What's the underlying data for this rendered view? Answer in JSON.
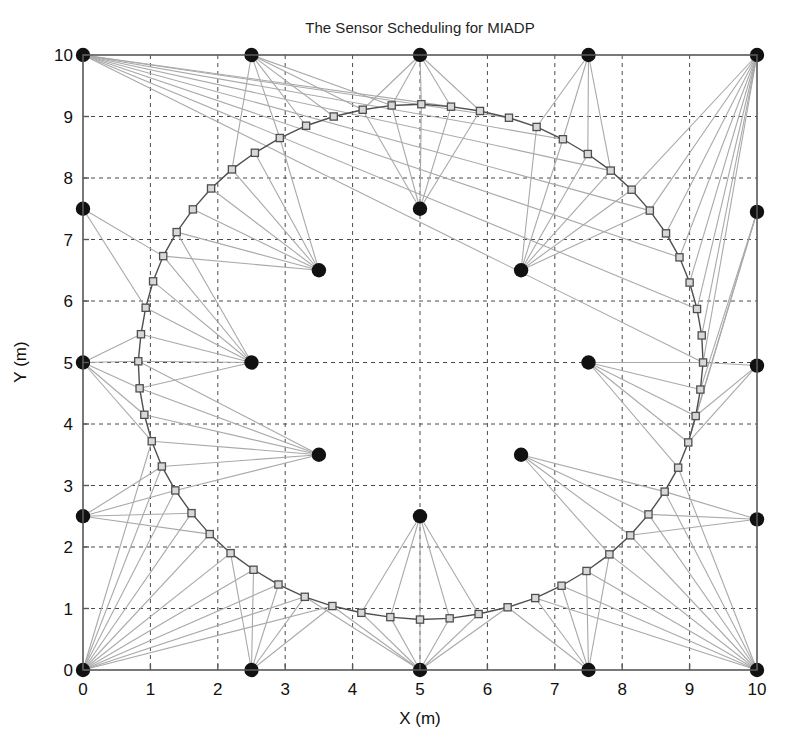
{
  "figure": {
    "title": "The Sensor Scheduling for MIADP",
    "caption_lead": "Fig. 1.",
    "caption_rest": "",
    "background": "#ffffff",
    "axis_color": "#585858",
    "grid_color": "#4a4a4a",
    "sensor_color": "#111111",
    "link_color": "#a9a9a9",
    "track_color": "#4f4f4f",
    "marker_fill": "#d8d8d8"
  },
  "chart_data": {
    "type": "scatter",
    "title": "The Sensor Scheduling for MIADP",
    "xlabel": "X (m)",
    "ylabel": "Y (m)",
    "xlim": [
      0,
      10
    ],
    "ylim": [
      0,
      10
    ],
    "xticks": [
      0,
      1,
      2,
      3,
      4,
      5,
      6,
      7,
      8,
      9,
      10
    ],
    "yticks": [
      0,
      1,
      2,
      3,
      4,
      5,
      6,
      7,
      8,
      9,
      10
    ],
    "xticklabels": [
      "0",
      "1",
      "2",
      "3",
      "4",
      "5",
      "6",
      "7",
      "8",
      "9",
      "10"
    ],
    "yticklabels": [
      "0",
      "1",
      "2",
      "3",
      "4",
      "5",
      "6",
      "7",
      "8",
      "9",
      "10"
    ],
    "grid": true,
    "grid_style": "dashed",
    "legend": null,
    "series": [
      {
        "name": "Sensors",
        "marker": "filled-circle",
        "color": "#111111",
        "points": [
          [
            0,
            0
          ],
          [
            2.5,
            0
          ],
          [
            5,
            0
          ],
          [
            7.5,
            0
          ],
          [
            10,
            0
          ],
          [
            0,
            2.5
          ],
          [
            10,
            2.45
          ],
          [
            0,
            5
          ],
          [
            10,
            4.95
          ],
          [
            0,
            7.5
          ],
          [
            10,
            7.45
          ],
          [
            0,
            10
          ],
          [
            2.5,
            10
          ],
          [
            5,
            10
          ],
          [
            7.5,
            10
          ],
          [
            10,
            10
          ],
          [
            3.5,
            6.5
          ],
          [
            6.5,
            6.5
          ],
          [
            2.5,
            5.0
          ],
          [
            7.5,
            5.0
          ],
          [
            3.5,
            3.5
          ],
          [
            6.5,
            3.5
          ],
          [
            5.0,
            7.5
          ],
          [
            5.0,
            2.5
          ]
        ]
      },
      {
        "name": "Target trajectory",
        "marker": "open-square",
        "color": "#4f4f4f",
        "closed": true,
        "center": [
          5.0,
          5.0
        ],
        "radius": 4.2,
        "n_points": 60,
        "points": [
          [
            9.2,
            5.0
          ],
          [
            9.18,
            5.44
          ],
          [
            9.11,
            5.87
          ],
          [
            9.0,
            6.3
          ],
          [
            8.85,
            6.71
          ],
          [
            8.65,
            7.1
          ],
          [
            8.41,
            7.47
          ],
          [
            8.14,
            7.81
          ],
          [
            7.83,
            8.12
          ],
          [
            7.49,
            8.39
          ],
          [
            7.12,
            8.63
          ],
          [
            6.73,
            8.83
          ],
          [
            6.32,
            8.98
          ],
          [
            5.89,
            9.09
          ],
          [
            5.46,
            9.16
          ],
          [
            5.02,
            9.2
          ],
          [
            4.58,
            9.18
          ],
          [
            4.15,
            9.11
          ],
          [
            3.72,
            9.0
          ],
          [
            3.31,
            8.85
          ],
          [
            2.92,
            8.65
          ],
          [
            2.55,
            8.41
          ],
          [
            2.21,
            8.14
          ],
          [
            1.9,
            7.83
          ],
          [
            1.63,
            7.49
          ],
          [
            1.39,
            7.12
          ],
          [
            1.19,
            6.73
          ],
          [
            1.04,
            6.32
          ],
          [
            0.93,
            5.89
          ],
          [
            0.86,
            5.46
          ],
          [
            0.82,
            5.02
          ],
          [
            0.84,
            4.58
          ],
          [
            0.91,
            4.15
          ],
          [
            1.02,
            3.72
          ],
          [
            1.17,
            3.31
          ],
          [
            1.37,
            2.92
          ],
          [
            1.61,
            2.55
          ],
          [
            1.88,
            2.21
          ],
          [
            2.19,
            1.9
          ],
          [
            2.53,
            1.63
          ],
          [
            2.9,
            1.39
          ],
          [
            3.29,
            1.19
          ],
          [
            3.7,
            1.04
          ],
          [
            4.13,
            0.93
          ],
          [
            4.56,
            0.86
          ],
          [
            5.0,
            0.82
          ],
          [
            5.44,
            0.84
          ],
          [
            5.87,
            0.91
          ],
          [
            6.3,
            1.02
          ],
          [
            6.71,
            1.17
          ],
          [
            7.1,
            1.37
          ],
          [
            7.47,
            1.61
          ],
          [
            7.81,
            1.88
          ],
          [
            8.12,
            2.19
          ],
          [
            8.39,
            2.53
          ],
          [
            8.63,
            2.9
          ],
          [
            8.83,
            3.29
          ],
          [
            8.98,
            3.7
          ],
          [
            9.09,
            4.13
          ],
          [
            9.16,
            4.56
          ]
        ]
      }
    ],
    "links": {
      "description": "Gray lines connecting each scheduled sensor to the target track points it observes",
      "color": "#a9a9a9",
      "pairs": [
        [
          [
            0,
            10
          ],
          0
        ],
        [
          [
            0,
            10
          ],
          2
        ],
        [
          [
            0,
            10
          ],
          4
        ],
        [
          [
            0,
            10
          ],
          6
        ],
        [
          [
            0,
            10
          ],
          8
        ],
        [
          [
            0,
            10
          ],
          10
        ],
        [
          [
            0,
            10
          ],
          12
        ],
        [
          [
            0,
            10
          ],
          14
        ],
        [
          [
            2.5,
            10
          ],
          16
        ],
        [
          [
            2.5,
            10
          ],
          17
        ],
        [
          [
            2.5,
            10
          ],
          18
        ],
        [
          [
            2.5,
            10
          ],
          19
        ],
        [
          [
            2.5,
            10
          ],
          20
        ],
        [
          [
            2.5,
            10
          ],
          22
        ],
        [
          [
            5,
            10
          ],
          13
        ],
        [
          [
            5,
            10
          ],
          14
        ],
        [
          [
            5,
            10
          ],
          15
        ],
        [
          [
            5,
            10
          ],
          16
        ],
        [
          [
            5,
            10
          ],
          17
        ],
        [
          [
            7.5,
            10
          ],
          8
        ],
        [
          [
            7.5,
            10
          ],
          9
        ],
        [
          [
            7.5,
            10
          ],
          10
        ],
        [
          [
            7.5,
            10
          ],
          11
        ],
        [
          [
            10,
            10
          ],
          0
        ],
        [
          [
            10,
            10
          ],
          1
        ],
        [
          [
            10,
            10
          ],
          2
        ],
        [
          [
            10,
            10
          ],
          3
        ],
        [
          [
            10,
            10
          ],
          4
        ],
        [
          [
            10,
            10
          ],
          5
        ],
        [
          [
            10,
            10
          ],
          6
        ],
        [
          [
            10,
            10
          ],
          7
        ],
        [
          [
            0,
            7.5
          ],
          26
        ],
        [
          [
            0,
            7.5
          ],
          28
        ],
        [
          [
            10,
            7.45
          ],
          57
        ],
        [
          [
            10,
            7.45
          ],
          58
        ],
        [
          [
            10,
            7.45
          ],
          59
        ],
        [
          [
            0,
            5
          ],
          29
        ],
        [
          [
            0,
            5
          ],
          30
        ],
        [
          [
            0,
            5
          ],
          31
        ],
        [
          [
            0,
            5
          ],
          32
        ],
        [
          [
            0,
            5
          ],
          33
        ],
        [
          [
            10,
            4.95
          ],
          0
        ],
        [
          [
            10,
            4.95
          ],
          57
        ],
        [
          [
            10,
            4.95
          ],
          58
        ],
        [
          [
            0,
            2.5
          ],
          34
        ],
        [
          [
            0,
            2.5
          ],
          35
        ],
        [
          [
            0,
            2.5
          ],
          36
        ],
        [
          [
            0,
            2.5
          ],
          37
        ],
        [
          [
            10,
            2.45
          ],
          53
        ],
        [
          [
            10,
            2.45
          ],
          54
        ],
        [
          [
            10,
            2.45
          ],
          55
        ],
        [
          [
            0,
            0
          ],
          33
        ],
        [
          [
            0,
            0
          ],
          34
        ],
        [
          [
            0,
            0
          ],
          35
        ],
        [
          [
            0,
            0
          ],
          36
        ],
        [
          [
            0,
            0
          ],
          37
        ],
        [
          [
            0,
            0
          ],
          38
        ],
        [
          [
            0,
            0
          ],
          39
        ],
        [
          [
            0,
            0
          ],
          40
        ],
        [
          [
            0,
            0
          ],
          41
        ],
        [
          [
            0,
            0
          ],
          42
        ],
        [
          [
            2.5,
            0
          ],
          38
        ],
        [
          [
            2.5,
            0
          ],
          39
        ],
        [
          [
            2.5,
            0
          ],
          40
        ],
        [
          [
            2.5,
            0
          ],
          41
        ],
        [
          [
            2.5,
            0
          ],
          42
        ],
        [
          [
            5,
            0
          ],
          41
        ],
        [
          [
            5,
            0
          ],
          42
        ],
        [
          [
            5,
            0
          ],
          43
        ],
        [
          [
            5,
            0
          ],
          44
        ],
        [
          [
            5,
            0
          ],
          45
        ],
        [
          [
            5,
            0
          ],
          46
        ],
        [
          [
            5,
            0
          ],
          47
        ],
        [
          [
            5,
            0
          ],
          48
        ],
        [
          [
            7.5,
            0
          ],
          48
        ],
        [
          [
            7.5,
            0
          ],
          49
        ],
        [
          [
            7.5,
            0
          ],
          50
        ],
        [
          [
            7.5,
            0
          ],
          51
        ],
        [
          [
            7.5,
            0
          ],
          52
        ],
        [
          [
            10,
            0
          ],
          49
        ],
        [
          [
            10,
            0
          ],
          50
        ],
        [
          [
            10,
            0
          ],
          51
        ],
        [
          [
            10,
            0
          ],
          52
        ],
        [
          [
            10,
            0
          ],
          53
        ],
        [
          [
            10,
            0
          ],
          54
        ],
        [
          [
            10,
            0
          ],
          55
        ],
        [
          [
            10,
            0
          ],
          56
        ],
        [
          [
            3.5,
            6.5
          ],
          20
        ],
        [
          [
            3.5,
            6.5
          ],
          21
        ],
        [
          [
            3.5,
            6.5
          ],
          22
        ],
        [
          [
            3.5,
            6.5
          ],
          23
        ],
        [
          [
            3.5,
            6.5
          ],
          24
        ],
        [
          [
            3.5,
            6.5
          ],
          25
        ],
        [
          [
            3.5,
            6.5
          ],
          26
        ],
        [
          [
            6.5,
            6.5
          ],
          6
        ],
        [
          [
            6.5,
            6.5
          ],
          7
        ],
        [
          [
            6.5,
            6.5
          ],
          8
        ],
        [
          [
            6.5,
            6.5
          ],
          9
        ],
        [
          [
            6.5,
            6.5
          ],
          10
        ],
        [
          [
            6.5,
            6.5
          ],
          11
        ],
        [
          [
            2.5,
            5
          ],
          25
        ],
        [
          [
            2.5,
            5
          ],
          26
        ],
        [
          [
            2.5,
            5
          ],
          27
        ],
        [
          [
            2.5,
            5
          ],
          28
        ],
        [
          [
            2.5,
            5
          ],
          29
        ],
        [
          [
            2.5,
            5
          ],
          30
        ],
        [
          [
            2.5,
            5
          ],
          31
        ],
        [
          [
            7.5,
            5
          ],
          0
        ],
        [
          [
            7.5,
            5
          ],
          56
        ],
        [
          [
            7.5,
            5
          ],
          57
        ],
        [
          [
            7.5,
            5
          ],
          58
        ],
        [
          [
            7.5,
            5
          ],
          59
        ],
        [
          [
            3.5,
            3.5
          ],
          30
        ],
        [
          [
            3.5,
            3.5
          ],
          31
        ],
        [
          [
            3.5,
            3.5
          ],
          32
        ],
        [
          [
            3.5,
            3.5
          ],
          33
        ],
        [
          [
            3.5,
            3.5
          ],
          34
        ],
        [
          [
            3.5,
            3.5
          ],
          35
        ],
        [
          [
            6.5,
            3.5
          ],
          52
        ],
        [
          [
            6.5,
            3.5
          ],
          53
        ],
        [
          [
            6.5,
            3.5
          ],
          54
        ],
        [
          [
            6.5,
            3.5
          ],
          55
        ],
        [
          [
            5,
            7.5
          ],
          13
        ],
        [
          [
            5,
            7.5
          ],
          14
        ],
        [
          [
            5,
            7.5
          ],
          15
        ],
        [
          [
            5,
            7.5
          ],
          16
        ],
        [
          [
            5,
            7.5
          ],
          17
        ],
        [
          [
            5,
            2.5
          ],
          43
        ],
        [
          [
            5,
            2.5
          ],
          44
        ],
        [
          [
            5,
            2.5
          ],
          45
        ],
        [
          [
            5,
            2.5
          ],
          46
        ],
        [
          [
            5,
            2.5
          ],
          47
        ]
      ]
    }
  }
}
